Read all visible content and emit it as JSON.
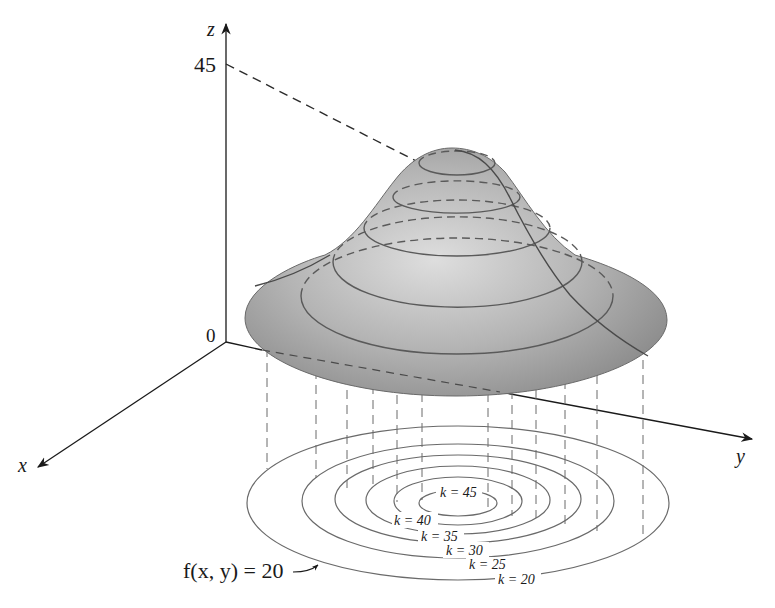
{
  "figure": {
    "colors": {
      "axis": "#1a1a1a",
      "surface_dark": "#8e8e8e",
      "surface_light": "#d6d6d6",
      "contour": "#555555",
      "dashed": "#4a4a4a",
      "level_curve": "#666666"
    }
  },
  "axes": {
    "x_label": "x",
    "y_label": "y",
    "z_label": "z",
    "origin_label": "0",
    "z_tick_label": "45"
  },
  "level_curves": [
    {
      "k": 45,
      "label": "k = 45"
    },
    {
      "k": 40,
      "label": "k = 40"
    },
    {
      "k": 35,
      "label": "k = 35"
    },
    {
      "k": 30,
      "label": "k = 30"
    },
    {
      "k": 25,
      "label": "k = 25"
    },
    {
      "k": 20,
      "label": "k = 20"
    }
  ],
  "annotation": {
    "text": "f(x, y) = 20"
  }
}
